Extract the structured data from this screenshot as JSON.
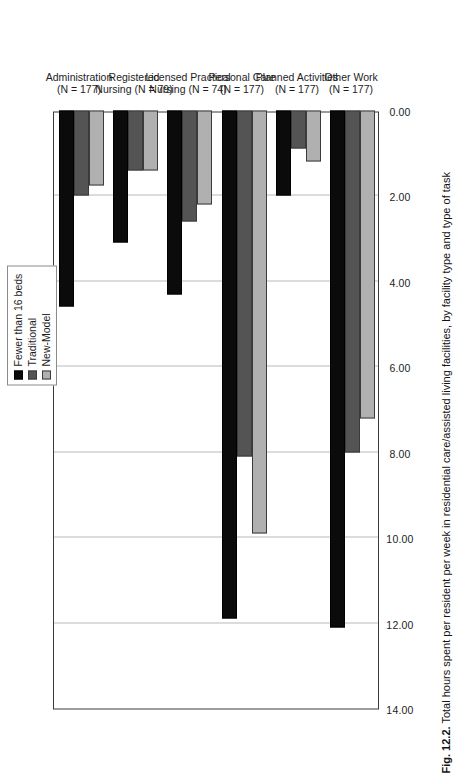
{
  "figure": {
    "caption_number": "Fig. 12.2.",
    "caption_text": "Total hours spent per resident per week in residential care/assisted living facilities, by facility type and type of task"
  },
  "legend": {
    "position": "top-right",
    "items": [
      {
        "label": "Fewer than 16 beds",
        "color": "#0b0b0b",
        "icon": "legend-swatch"
      },
      {
        "label": "Traditional",
        "color": "#545454",
        "icon": "legend-swatch"
      },
      {
        "label": "New-Model",
        "color": "#b0b0b0",
        "icon": "legend-swatch"
      }
    ]
  },
  "axis": {
    "ticks": [
      "14.00",
      "12.00",
      "10.00",
      "8.00",
      "6.00",
      "4.00",
      "2.00",
      "0.00"
    ]
  },
  "categories_display": [
    {
      "line1": "Administration",
      "line2": "(N = 177)"
    },
    {
      "line1": "Registered",
      "line2": "Nursing  (N = 79)"
    },
    {
      "line1": "Licensed Practical",
      "line2": "Nursing (N = 74)"
    },
    {
      "line1": "Personal Care",
      "line2": "(N = 177)"
    },
    {
      "line1": "Planned Activities",
      "line2": "(N = 177)"
    },
    {
      "line1": "Other Work",
      "line2": "(N = 177)"
    }
  ],
  "chart_data": {
    "type": "bar",
    "orientation": "vertical",
    "title": "",
    "subtitle": "",
    "xlabel": "",
    "ylabel": "",
    "ylim": [
      0,
      14
    ],
    "ytick_step": 2,
    "grid": true,
    "legend_position": "top-right",
    "categories": [
      "Administration (N = 177)",
      "Registered Nursing (N = 79)",
      "Licensed Practical Nursing (N = 74)",
      "Personal Care (N = 177)",
      "Planned Activities (N = 177)",
      "Other Work (N = 177)"
    ],
    "series": [
      {
        "name": "Fewer than 16 beds",
        "color": "#0b0b0b",
        "values": [
          4.6,
          3.1,
          4.3,
          11.9,
          2.0,
          12.1
        ]
      },
      {
        "name": "Traditional",
        "color": "#545454",
        "values": [
          2.0,
          1.4,
          2.6,
          8.1,
          0.9,
          8.0
        ]
      },
      {
        "name": "New-Model",
        "color": "#b0b0b0",
        "values": [
          1.75,
          1.4,
          2.2,
          9.9,
          1.2,
          7.2
        ]
      }
    ]
  }
}
